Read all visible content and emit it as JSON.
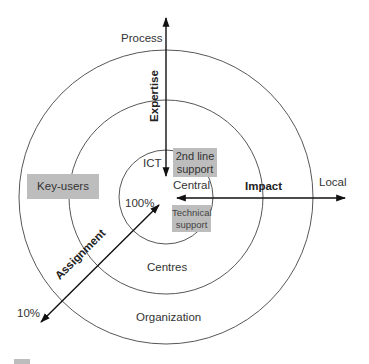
{
  "diagram": {
    "rings": {
      "inner": "Central",
      "middle": "Centres",
      "outer": "Organization"
    },
    "axes": {
      "vertical": {
        "label": "Expertise",
        "end_label": "Process"
      },
      "horizontal": {
        "label": "Impact",
        "end_label": "Local"
      },
      "diagonal": {
        "label": "Assignment",
        "start_label": "10%",
        "end_label": "100%"
      }
    },
    "labels": {
      "ict": "ICT"
    },
    "boxes": {
      "second_line": "2nd line support",
      "second_line_l1": "2nd line",
      "second_line_l2": "support",
      "key_users": "Key-users",
      "technical": "Technical support",
      "technical_l1": "Technical",
      "technical_l2": "support"
    },
    "colors": {
      "box_fill": "#bdbdbd",
      "line": "#222222",
      "circle": "#444444"
    }
  }
}
